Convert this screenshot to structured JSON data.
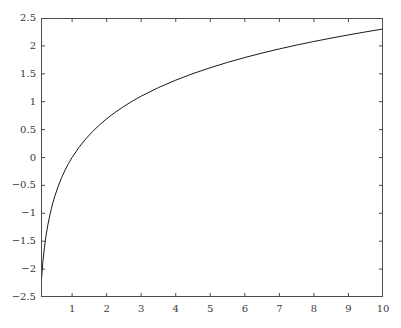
{
  "chart_data": {
    "type": "line",
    "title": "",
    "subtitle": "",
    "xlabel": "",
    "ylabel": "",
    "xlim": [
      0.1,
      10
    ],
    "ylim": [
      -2.5,
      2.5
    ],
    "grid": false,
    "legend": null,
    "annotations": [],
    "xticks": [
      1,
      2,
      3,
      4,
      5,
      6,
      7,
      8,
      9,
      10
    ],
    "xtick_labels": [
      "1",
      "2",
      "3",
      "4",
      "5",
      "6",
      "7",
      "8",
      "9",
      "10"
    ],
    "yticks": [
      -2.5,
      -2,
      -1.5,
      -1,
      -0.5,
      0,
      0.5,
      1,
      1.5,
      2,
      2.5
    ],
    "ytick_labels": [
      "−2.5",
      "−2",
      "−1.5",
      "−1",
      "−0.5",
      "0",
      "0.5",
      "1",
      "1.5",
      "2",
      "2.5"
    ],
    "series": [
      {
        "name": "natural logarithm",
        "expression": "ln(x)",
        "color": "#1a1a1a",
        "line_width": 1,
        "x": [
          0.1,
          0.15,
          0.2,
          0.25,
          0.3,
          0.35,
          0.4,
          0.45,
          0.5,
          0.6,
          0.7,
          0.8,
          0.9,
          1.0,
          1.2,
          1.4,
          1.6,
          1.8,
          2.0,
          2.25,
          2.5,
          2.75,
          3.0,
          3.5,
          4.0,
          4.5,
          5.0,
          5.5,
          6.0,
          6.5,
          7.0,
          7.5,
          8.0,
          8.5,
          9.0,
          9.5,
          10.0
        ],
        "y": [
          -2.303,
          -1.897,
          -1.609,
          -1.386,
          -1.204,
          -1.05,
          -0.916,
          -0.799,
          -0.693,
          -0.511,
          -0.357,
          -0.223,
          -0.105,
          0.0,
          0.182,
          0.336,
          0.47,
          0.588,
          0.693,
          0.811,
          0.916,
          1.012,
          1.099,
          1.253,
          1.386,
          1.504,
          1.609,
          1.705,
          1.792,
          1.872,
          1.946,
          2.015,
          2.079,
          2.14,
          2.197,
          2.251,
          2.303
        ]
      }
    ],
    "axes_style": {
      "spines": [
        "left",
        "right",
        "top",
        "bottom"
      ],
      "tick_direction": "in",
      "axis_color": "#4d4d4d",
      "background": "#ffffff"
    }
  }
}
